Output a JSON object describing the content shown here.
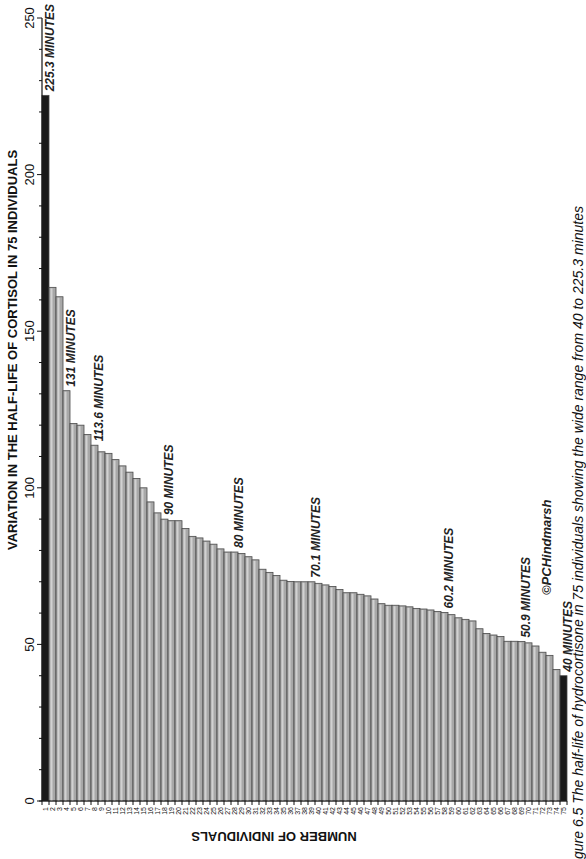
{
  "chart_data": {
    "type": "bar",
    "orientation": "rotated-90-clockwise-page",
    "title": "VARIATION IN THE HALF-LIFE OF CORTISOL IN 75 INDIVIDUALS",
    "xlabel": "NUMBER OF INDIVIDUALS",
    "ylabel": "VARIATION IN THE HALF-LIFE OF CORTISOL IN 75 INDIVIDUALS",
    "ylim": [
      0,
      250
    ],
    "yticks": [
      0,
      50,
      100,
      150,
      200,
      250
    ],
    "grid": false,
    "legend": null,
    "categories": [
      "1",
      "2",
      "3",
      "4",
      "5",
      "6",
      "7",
      "8",
      "9",
      "10",
      "11",
      "12",
      "13",
      "14",
      "15",
      "16",
      "17",
      "18",
      "19",
      "20",
      "21",
      "22",
      "23",
      "24",
      "25",
      "26",
      "27",
      "28",
      "29",
      "30",
      "31",
      "32",
      "33",
      "34",
      "35",
      "36",
      "37",
      "38",
      "39",
      "40",
      "41",
      "42",
      "43",
      "44",
      "45",
      "46",
      "47",
      "48",
      "49",
      "50",
      "51",
      "52",
      "53",
      "54",
      "55",
      "56",
      "57",
      "58",
      "59",
      "60",
      "61",
      "62",
      "63",
      "64",
      "65",
      "66",
      "67",
      "68",
      "69",
      "70",
      "71",
      "72",
      "73",
      "74",
      "75"
    ],
    "values": [
      225.3,
      164,
      161,
      131,
      120.5,
      120,
      117,
      113.6,
      111.5,
      111,
      109,
      107,
      105,
      103,
      100,
      95.5,
      92,
      90,
      89.5,
      89.5,
      87,
      84.5,
      84,
      83,
      82,
      80.5,
      79.5,
      79.5,
      79,
      78,
      77,
      74,
      73,
      72,
      70.5,
      70.1,
      70,
      70,
      70,
      69.5,
      69,
      68.5,
      67.5,
      66.5,
      66.5,
      66,
      65.5,
      64.5,
      63,
      62.5,
      62.5,
      62.3,
      62,
      61.5,
      61.3,
      61,
      60.5,
      60.2,
      59.5,
      58.5,
      58,
      57.5,
      55,
      53.5,
      53,
      52.5,
      51,
      51,
      50.9,
      50.5,
      49.5,
      47.5,
      46.5,
      42,
      40
    ],
    "highlighted_bars": [
      1,
      75
    ],
    "annotations": [
      {
        "bar": 1,
        "text": "225.3 MINUTES"
      },
      {
        "bar": 4,
        "text": "131 MINUTES"
      },
      {
        "bar": 8,
        "text": "113.6 MINUTES"
      },
      {
        "bar": 18,
        "text": "90 MINUTES"
      },
      {
        "bar": 28,
        "text": "80 MINUTES"
      },
      {
        "bar": 39,
        "text": "70.1 MINUTES"
      },
      {
        "bar": 58,
        "text": "60.2 MINUTES"
      },
      {
        "bar": 69,
        "text": "50.9 MINUTES"
      },
      {
        "bar": 75,
        "text": "40 MINUTES"
      }
    ]
  },
  "copyright": "©PCHindmarsh",
  "caption": "gure 6.5  The half-life of hydrocortisone in 75 individuals showing the wide range from 40 to 225.3 minutes",
  "colors": {
    "bar_fill": "#a8a8a8",
    "bar_edge": "#4a4a4a",
    "highlight_fill": "#1a1a1a",
    "axis": "#111111"
  }
}
